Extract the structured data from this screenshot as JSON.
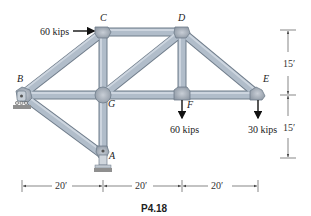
{
  "figure": {
    "caption": "P4.18",
    "colors": {
      "member_fill": "#a9b6c4",
      "member_edge": "#6f7c8a",
      "joint_fill": "#b4bcc6",
      "support_fill": "#b9c2cc",
      "ground_fill": "#8f8f8f",
      "arrow": "#111111",
      "dim_line": "#555555"
    },
    "joints": {
      "A": {
        "label": "A",
        "x": 103,
        "y": 155
      },
      "B": {
        "label": "B",
        "x": 22,
        "y": 95
      },
      "C": {
        "label": "C",
        "x": 103,
        "y": 32
      },
      "D": {
        "label": "D",
        "x": 182,
        "y": 32
      },
      "E": {
        "label": "E",
        "x": 258,
        "y": 95
      },
      "F": {
        "label": "F",
        "x": 182,
        "y": 95
      },
      "G": {
        "label": "G",
        "x": 103,
        "y": 95
      }
    },
    "members": [
      [
        "B",
        "C"
      ],
      [
        "C",
        "D"
      ],
      [
        "D",
        "E"
      ],
      [
        "B",
        "G"
      ],
      [
        "G",
        "F"
      ],
      [
        "F",
        "E"
      ],
      [
        "C",
        "G"
      ],
      [
        "D",
        "F"
      ],
      [
        "G",
        "D"
      ],
      [
        "B",
        "A"
      ],
      [
        "G",
        "A"
      ]
    ],
    "loads": [
      {
        "joint": "C",
        "label": "60 kips",
        "direction": "right"
      },
      {
        "joint": "F",
        "label": "60 kips",
        "direction": "down"
      },
      {
        "joint": "E",
        "label": "30 kips",
        "direction": "down"
      }
    ],
    "supports": [
      {
        "joint": "B",
        "type": "roller"
      },
      {
        "joint": "A",
        "type": "pin"
      }
    ],
    "dimensions": {
      "horizontal": [
        "20′",
        "20′",
        "20′"
      ],
      "vertical": [
        "15′",
        "15′"
      ]
    }
  }
}
